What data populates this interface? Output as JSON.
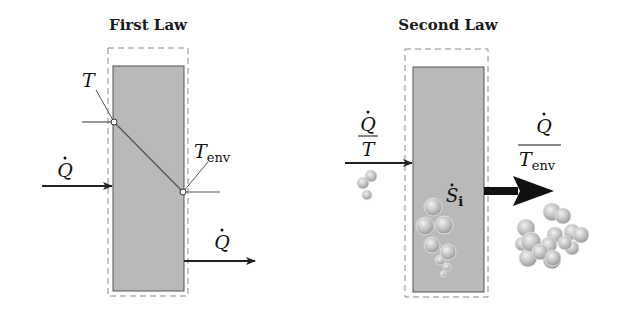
{
  "panels": [
    {
      "title": "First Law",
      "labels": {
        "temperature_inside": "T",
        "temperature_env_main": "T",
        "temperature_env_sub": "env",
        "heat_in": "Q",
        "heat_out": "Q"
      }
    },
    {
      "title": "Second Law",
      "labels": {
        "entropy_in_numerator": "Q",
        "entropy_in_denominator": "T",
        "entropy_out_numerator": "Q",
        "entropy_out_denominator_main": "T",
        "entropy_out_denominator_sub": "env",
        "entropy_generation_main": "S",
        "entropy_generation_sub": "i"
      }
    }
  ],
  "colors": {
    "system_fill": "#b9b9b9",
    "system_stroke": "#555555",
    "boundary_dash": "#8a8a8a",
    "arrow": "#222222",
    "particle": "#bdbdbd"
  }
}
